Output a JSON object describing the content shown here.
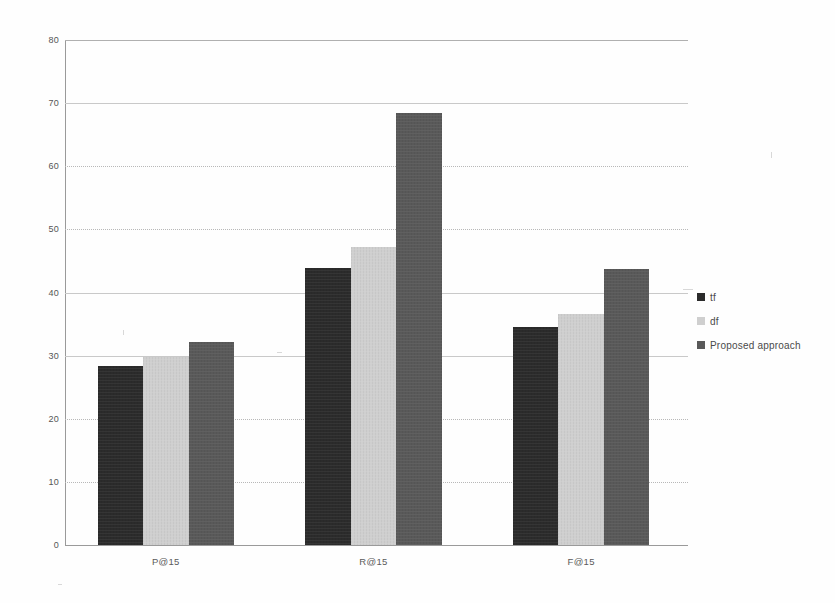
{
  "chart_data": {
    "type": "bar",
    "title": "",
    "subtitle": "",
    "xlabel": "",
    "ylabel": "",
    "categories": [
      "P@15",
      "R@15",
      "F@15"
    ],
    "series": [
      {
        "name": "tf",
        "color": "#2b2b2b",
        "values": [
          28.4,
          43.9,
          34.5
        ]
      },
      {
        "name": "df",
        "color": "#cfcfcf",
        "values": [
          29.8,
          47.2,
          36.6
        ]
      },
      {
        "name": "Proposed approach",
        "color": "#595959",
        "values": [
          32.2,
          68.5,
          43.7
        ]
      }
    ],
    "ylim": [
      0,
      80
    ],
    "ytick_step": 10,
    "yticks": [
      80,
      70,
      60,
      50,
      40,
      30,
      20,
      10,
      0
    ],
    "ytick_labels": [
      "80",
      "70",
      "60",
      "50",
      "40",
      "30",
      "20",
      "10",
      "0"
    ],
    "grid": true,
    "grid_axis": "y",
    "legend_position": "right",
    "legend_entries": [
      "tf",
      "df",
      "Proposed approach"
    ],
    "annotations": []
  }
}
